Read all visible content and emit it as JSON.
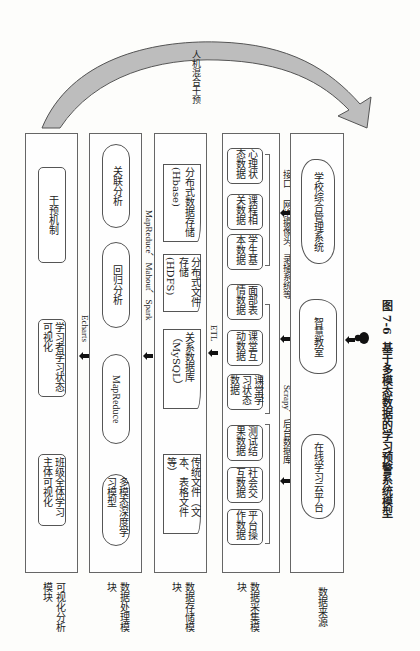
{
  "figure": {
    "number": "图 7-6",
    "caption": "基于多模态数据的学习预警系统模型",
    "feedback_arrow_label": "人机混合干预"
  },
  "layers": [
    {
      "id": "visualization",
      "label": "可视化分析模块",
      "items": [
        "班级全体学习主体可视化",
        "学习者学习状态可视化",
        "干预机制"
      ]
    },
    {
      "id": "processing",
      "label": "数据处理模块",
      "items": [
        "多模态深度学习模型",
        "MapReduce",
        "回归分析",
        "关联分析"
      ]
    },
    {
      "id": "storage",
      "label": "数据存储模块",
      "items": [
        "传统文件（文本、表格文件等）",
        "关系数据库（MySQL）",
        "分布式文件存储(HDFS)",
        "分布式数据存储(Hbase)"
      ]
    },
    {
      "id": "collection",
      "label": "数据采集模块",
      "items": [
        "平台操作数据",
        "社会交互数据",
        "测试结果数据",
        "课堂学习状态数据",
        "课堂互动数据",
        "面部表情数据",
        "学生基本数据",
        "课程相关数据",
        "心理状态数据"
      ]
    },
    {
      "id": "source",
      "label": "数据来源",
      "items": [
        "在线学习云平台",
        "智慧教室",
        "学校综合管理系统"
      ]
    }
  ],
  "connectors": {
    "processing_to_visualization": "Echarts",
    "storage_to_processing": "MapReduce、Mahout、Spark",
    "collection_to_storage": "ETL",
    "source_to_collection": [
      "Scrapy、后台数据库",
      "网络摄像头、录播系统等",
      "接口"
    ]
  }
}
